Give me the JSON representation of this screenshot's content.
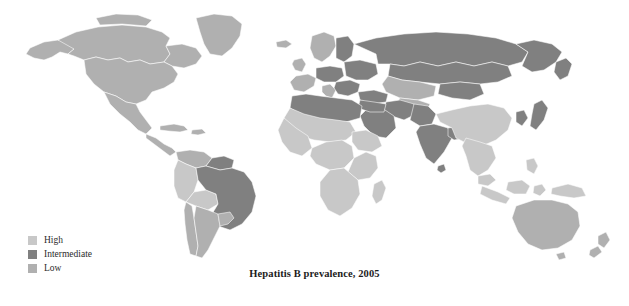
{
  "figure": {
    "caption": "Hepatitis B prevalence, 2005",
    "note": ""
  },
  "legend": {
    "items": [
      {
        "label": "High",
        "color": "#c8c8c8"
      },
      {
        "label": "Intermediate",
        "color": "#808080"
      },
      {
        "label": "Low",
        "color": "#b0b0b0"
      }
    ]
  },
  "map": {
    "type": "choropleth-world",
    "background": "#ffffff",
    "border_color": "#ffffff",
    "categories": {
      "high": "#c8c8c8",
      "intermediate": "#808080",
      "low": "#b0b0b0"
    },
    "regions": [
      {
        "name": "greenland",
        "category": "low"
      },
      {
        "name": "alaska",
        "category": "low"
      },
      {
        "name": "canada",
        "category": "low"
      },
      {
        "name": "united-states",
        "category": "low"
      },
      {
        "name": "mexico",
        "category": "low"
      },
      {
        "name": "central-america",
        "category": "low"
      },
      {
        "name": "caribbean",
        "category": "low"
      },
      {
        "name": "colombia-venezuela",
        "category": "low"
      },
      {
        "name": "guyana-suriname",
        "category": "intermediate"
      },
      {
        "name": "peru-bolivia-ecuador",
        "category": "low"
      },
      {
        "name": "brazil",
        "category": "intermediate"
      },
      {
        "name": "chile-argentina-uruguay",
        "category": "low"
      },
      {
        "name": "iceland-scandinavia",
        "category": "low"
      },
      {
        "name": "western-europe",
        "category": "low"
      },
      {
        "name": "eastern-europe-balkans",
        "category": "intermediate"
      },
      {
        "name": "russia",
        "category": "intermediate"
      },
      {
        "name": "central-asia",
        "category": "intermediate"
      },
      {
        "name": "north-africa",
        "category": "intermediate"
      },
      {
        "name": "middle-east",
        "category": "intermediate"
      },
      {
        "name": "sub-saharan-africa",
        "category": "high"
      },
      {
        "name": "madagascar",
        "category": "high"
      },
      {
        "name": "india-subcontinent",
        "category": "intermediate"
      },
      {
        "name": "china",
        "category": "high"
      },
      {
        "name": "mongolia",
        "category": "intermediate"
      },
      {
        "name": "korea-japan",
        "category": "intermediate"
      },
      {
        "name": "southeast-asia",
        "category": "high"
      },
      {
        "name": "indonesia-philippines",
        "category": "high"
      },
      {
        "name": "papua-new-guinea",
        "category": "high"
      },
      {
        "name": "australia",
        "category": "low"
      },
      {
        "name": "new-zealand",
        "category": "low"
      }
    ]
  }
}
